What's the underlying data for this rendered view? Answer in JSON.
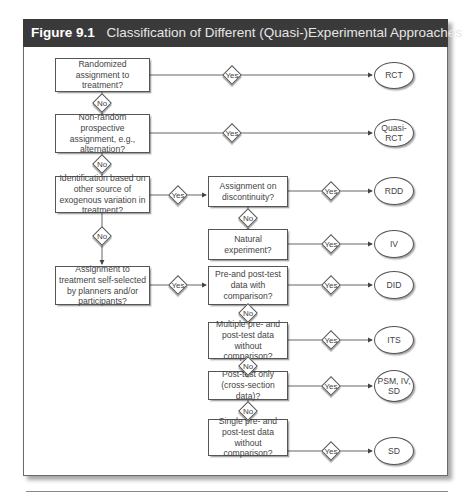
{
  "figure": {
    "number": "Figure 9.1",
    "title": "Classification of Different (Quasi-)Experimental Approaches"
  },
  "colors": {
    "title_bar": "#3a3a3a",
    "title_text": "#ffffff",
    "stroke": "#555555",
    "text": "#444444"
  },
  "labels": {
    "yes": "Yes",
    "no": "No"
  },
  "decisions": {
    "randomized": "Randomized assignment to treatment?",
    "nonrandom": "Non-random prospective assignment, e.g., alternation?",
    "identification": "Identification based on other source of exogenous variation in treatment?",
    "self_selected": "Assignment to treatment self-selected by planners and/or participants?",
    "discontinuity": "Assignment on discontinuity?",
    "natural": "Natural experiment?",
    "pre_post_comparison": "Pre-and post-test data with comparison?",
    "multiple_pre_post": "Multiple pre- and post-test data without comparison?",
    "post_test_only": "Post-test only (cross-section data)?",
    "single_pre_post": "Single pre- and post-test data without comparison?"
  },
  "outcomes": {
    "rct": "RCT",
    "quasi_rct": "Quasi-RCT",
    "rdd": "RDD",
    "iv": "IV",
    "did": "DID",
    "its": "ITS",
    "psm": "PSM, IV, SD",
    "sd": "SD"
  }
}
